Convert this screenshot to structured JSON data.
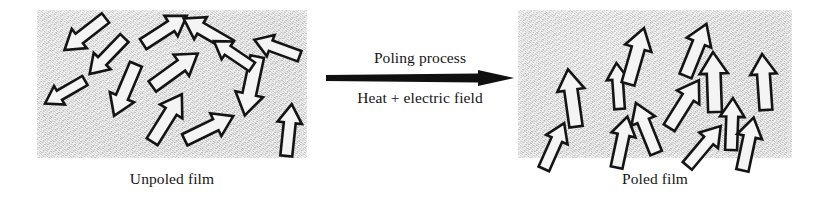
{
  "figure": {
    "type": "process-diagram",
    "background_color": "#ffffff",
    "panels": [
      {
        "id": "unpoled",
        "caption": "Unpoled film",
        "fill_color": "#d7d7d7",
        "texture": "speckled-grain",
        "arrow_state": "randomly oriented dipoles",
        "arrow_outline_color": "#141414",
        "arrow_fill_color": "#f4f4f4",
        "arrows": [
          {
            "x": 48,
            "y": 24,
            "angle": 218,
            "length": 52
          },
          {
            "x": 128,
            "y": 20,
            "angle": 33,
            "length": 52
          },
          {
            "x": 170,
            "y": 22,
            "angle": 150,
            "length": 54
          },
          {
            "x": 240,
            "y": 38,
            "angle": 160,
            "length": 48
          },
          {
            "x": 28,
            "y": 82,
            "angle": 210,
            "length": 46
          },
          {
            "x": 88,
            "y": 80,
            "angle": 247,
            "length": 56
          },
          {
            "x": 130,
            "y": 108,
            "angle": 58,
            "length": 56
          },
          {
            "x": 138,
            "y": 60,
            "angle": 36,
            "length": 56
          },
          {
            "x": 172,
            "y": 118,
            "angle": 26,
            "length": 54
          },
          {
            "x": 214,
            "y": 76,
            "angle": 258,
            "length": 60
          },
          {
            "x": 252,
            "y": 120,
            "angle": 84,
            "length": 52
          },
          {
            "x": 196,
            "y": 44,
            "angle": 146,
            "length": 46
          },
          {
            "x": 70,
            "y": 46,
            "angle": 226,
            "length": 50
          }
        ]
      },
      {
        "id": "poled",
        "caption": "Poled film",
        "fill_color": "#d7d7d7",
        "texture": "speckled-grain",
        "arrow_state": "aligned dipoles pointing upward",
        "arrow_outline_color": "#141414",
        "arrow_fill_color": "#f4f4f4",
        "arrows": [
          {
            "x": 54,
            "y": 88,
            "angle": 98,
            "length": 58
          },
          {
            "x": 100,
            "y": 76,
            "angle": 94,
            "length": 46
          },
          {
            "x": 104,
            "y": 132,
            "angle": 78,
            "length": 52
          },
          {
            "x": 118,
            "y": 46,
            "angle": 74,
            "length": 58
          },
          {
            "x": 128,
            "y": 118,
            "angle": 112,
            "length": 54
          },
          {
            "x": 166,
            "y": 94,
            "angle": 58,
            "length": 56
          },
          {
            "x": 178,
            "y": 40,
            "angle": 68,
            "length": 56
          },
          {
            "x": 186,
            "y": 136,
            "angle": 50,
            "length": 52
          },
          {
            "x": 196,
            "y": 72,
            "angle": 92,
            "length": 60
          },
          {
            "x": 214,
            "y": 114,
            "angle": 88,
            "length": 52
          },
          {
            "x": 230,
            "y": 134,
            "angle": 78,
            "length": 54
          },
          {
            "x": 246,
            "y": 72,
            "angle": 94,
            "length": 56
          },
          {
            "x": 36,
            "y": 136,
            "angle": 66,
            "length": 50
          }
        ]
      }
    ],
    "process": {
      "top_label": "Poling process",
      "bottom_label": "Heat + electric field",
      "arrow_direction": "right",
      "arrow_color": "#101010"
    }
  }
}
